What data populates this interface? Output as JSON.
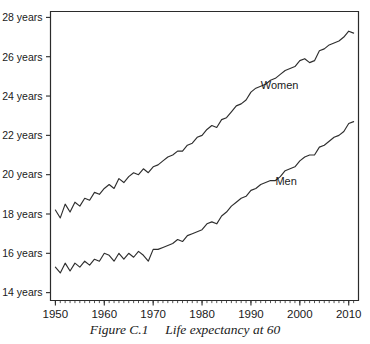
{
  "figure": {
    "caption_number": "Figure C.1",
    "caption_text": "Life expectancy at 60",
    "caption_full": "Figure C.1  Life expectancy at 60"
  },
  "chart_data": {
    "type": "line",
    "title": "Life expectancy at 60",
    "xlabel": "",
    "ylabel": "",
    "xlim": [
      1949,
      2012
    ],
    "ylim": [
      13.6,
      28.3
    ],
    "grid": false,
    "legend": "inline-annotations",
    "x_ticks": [
      1950,
      1960,
      1970,
      1980,
      1990,
      2000,
      2010
    ],
    "x_tick_labels": [
      "1950",
      "1960",
      "1970",
      "1980",
      "1990",
      "2000",
      "2010"
    ],
    "x_minor_tick_step": 1,
    "y_ticks": [
      14,
      16,
      18,
      20,
      22,
      24,
      26,
      28
    ],
    "y_tick_labels": [
      "14 years",
      "16 years",
      "18 years",
      "20 years",
      "22 years",
      "24 years",
      "26 years",
      "28 years"
    ],
    "line_color": "#2e2e2e",
    "series": [
      {
        "name": "Women",
        "label": "Women",
        "label_x": 1992,
        "label_y": 24.35,
        "x": [
          1950,
          1951,
          1952,
          1953,
          1954,
          1955,
          1956,
          1957,
          1958,
          1959,
          1960,
          1961,
          1962,
          1963,
          1964,
          1965,
          1966,
          1967,
          1968,
          1969,
          1970,
          1971,
          1972,
          1973,
          1974,
          1975,
          1976,
          1977,
          1978,
          1979,
          1980,
          1981,
          1982,
          1983,
          1984,
          1985,
          1986,
          1987,
          1988,
          1989,
          1990,
          1991,
          1992,
          1993,
          1994,
          1995,
          1996,
          1997,
          1998,
          1999,
          2000,
          2001,
          2002,
          2003,
          2004,
          2005,
          2006,
          2007,
          2008,
          2009,
          2010,
          2011
        ],
        "values": [
          18.2,
          17.8,
          18.5,
          18.1,
          18.6,
          18.4,
          18.8,
          18.7,
          19.1,
          19.0,
          19.3,
          19.5,
          19.3,
          19.8,
          19.6,
          19.9,
          20.1,
          20.0,
          20.3,
          20.1,
          20.4,
          20.5,
          20.7,
          20.9,
          21.0,
          21.2,
          21.2,
          21.5,
          21.6,
          21.9,
          22.0,
          22.3,
          22.5,
          22.4,
          22.8,
          22.9,
          23.2,
          23.5,
          23.6,
          23.8,
          24.2,
          24.4,
          24.5,
          24.6,
          24.8,
          24.9,
          25.1,
          25.3,
          25.4,
          25.5,
          25.8,
          25.9,
          25.7,
          25.8,
          26.3,
          26.4,
          26.6,
          26.7,
          26.8,
          27.0,
          27.3,
          27.2
        ]
      },
      {
        "name": "Men",
        "label": "Men",
        "label_x": 1995,
        "label_y": 19.45,
        "x": [
          1950,
          1951,
          1952,
          1953,
          1954,
          1955,
          1956,
          1957,
          1958,
          1959,
          1960,
          1961,
          1962,
          1963,
          1964,
          1965,
          1966,
          1967,
          1968,
          1969,
          1970,
          1971,
          1972,
          1973,
          1974,
          1975,
          1976,
          1977,
          1978,
          1979,
          1980,
          1981,
          1982,
          1983,
          1984,
          1985,
          1986,
          1987,
          1988,
          1989,
          1990,
          1991,
          1992,
          1993,
          1994,
          1995,
          1996,
          1997,
          1998,
          1999,
          2000,
          2001,
          2002,
          2003,
          2004,
          2005,
          2006,
          2007,
          2008,
          2009,
          2010,
          2011
        ],
        "values": [
          15.3,
          15.0,
          15.5,
          15.1,
          15.5,
          15.3,
          15.6,
          15.4,
          15.7,
          15.6,
          16.0,
          15.9,
          15.6,
          16.0,
          15.7,
          16.0,
          15.8,
          16.1,
          15.9,
          15.6,
          16.2,
          16.2,
          16.3,
          16.4,
          16.5,
          16.7,
          16.6,
          16.9,
          17.0,
          17.1,
          17.2,
          17.5,
          17.6,
          17.5,
          17.9,
          18.1,
          18.4,
          18.6,
          18.8,
          18.9,
          19.2,
          19.3,
          19.5,
          19.6,
          19.7,
          19.7,
          19.9,
          20.2,
          20.3,
          20.4,
          20.7,
          20.9,
          21.0,
          21.0,
          21.4,
          21.5,
          21.7,
          21.9,
          22.0,
          22.2,
          22.6,
          22.7
        ]
      }
    ]
  }
}
